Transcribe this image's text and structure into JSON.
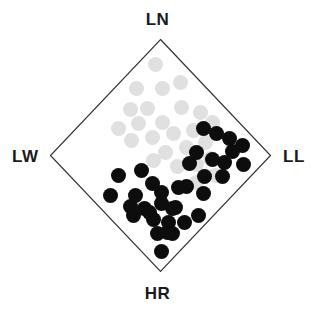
{
  "figure": {
    "type": "ternary-like-diamond-scatter",
    "background_color": "#ffffff",
    "outline_color": "#333333",
    "outline_width": 1.2
  },
  "axes": {
    "top_label": "LN",
    "bottom_label": "HR",
    "left_label": "LW",
    "right_label": "LL"
  },
  "diamond": {
    "center_x": 160.5,
    "center_y": 155.5,
    "half_width": 110,
    "half_height": 116,
    "top": [
      160.5,
      39.5
    ],
    "right": [
      270.5,
      155.5
    ],
    "bottom": [
      160.5,
      271.5
    ],
    "left": [
      50.5,
      155.5
    ]
  },
  "chart_data": {
    "type": "scatter",
    "title": "",
    "xlabel": "",
    "ylabel": "",
    "grid": false,
    "legend": null,
    "series": [
      {
        "name": "light-gray-group",
        "color": "#e0e0e0",
        "marker": "circle",
        "marker_size": 15,
        "points": [
          [
            155,
            64
          ],
          [
            136,
            88
          ],
          [
            162,
            88
          ],
          [
            180,
            82
          ],
          [
            130,
            109
          ],
          [
            147,
            108
          ],
          [
            181,
            107
          ],
          [
            200,
            112
          ],
          [
            138,
            123
          ],
          [
            162,
            122
          ],
          [
            212,
            122
          ],
          [
            152,
            137
          ],
          [
            173,
            133
          ],
          [
            193,
            130
          ],
          [
            165,
            152
          ],
          [
            186,
            147
          ],
          [
            205,
            142
          ],
          [
            196,
            164
          ],
          [
            177,
            166
          ],
          [
            210,
            158
          ],
          [
            215,
            175
          ],
          [
            196,
            182
          ],
          [
            153,
            160
          ],
          [
            131,
            140
          ],
          [
            118,
            128
          ]
        ]
      },
      {
        "name": "black-group",
        "color": "#0d0d0d",
        "marker": "circle",
        "marker_size": 15,
        "points": [
          [
            203,
            128
          ],
          [
            216,
            133
          ],
          [
            229,
            138
          ],
          [
            242,
            145
          ],
          [
            196,
            152
          ],
          [
            212,
            159
          ],
          [
            224,
            162
          ],
          [
            243,
            164
          ],
          [
            222,
            176
          ],
          [
            204,
            176
          ],
          [
            232,
            151
          ],
          [
            189,
            163
          ],
          [
            186,
            186
          ],
          [
            203,
            193
          ],
          [
            141,
            170
          ],
          [
            118,
            175
          ],
          [
            152,
            183
          ],
          [
            110,
            195
          ],
          [
            135,
            195
          ],
          [
            161,
            192
          ],
          [
            178,
            187
          ],
          [
            133,
            215
          ],
          [
            144,
            208
          ],
          [
            153,
            219
          ],
          [
            161,
            203
          ],
          [
            168,
            222
          ],
          [
            175,
            207
          ],
          [
            172,
            208
          ],
          [
            157,
            233
          ],
          [
            172,
            233
          ],
          [
            167,
            232
          ],
          [
            198,
            215
          ],
          [
            161,
            251
          ],
          [
            149,
            212
          ],
          [
            130,
            206
          ],
          [
            184,
            222
          ]
        ]
      }
    ]
  }
}
